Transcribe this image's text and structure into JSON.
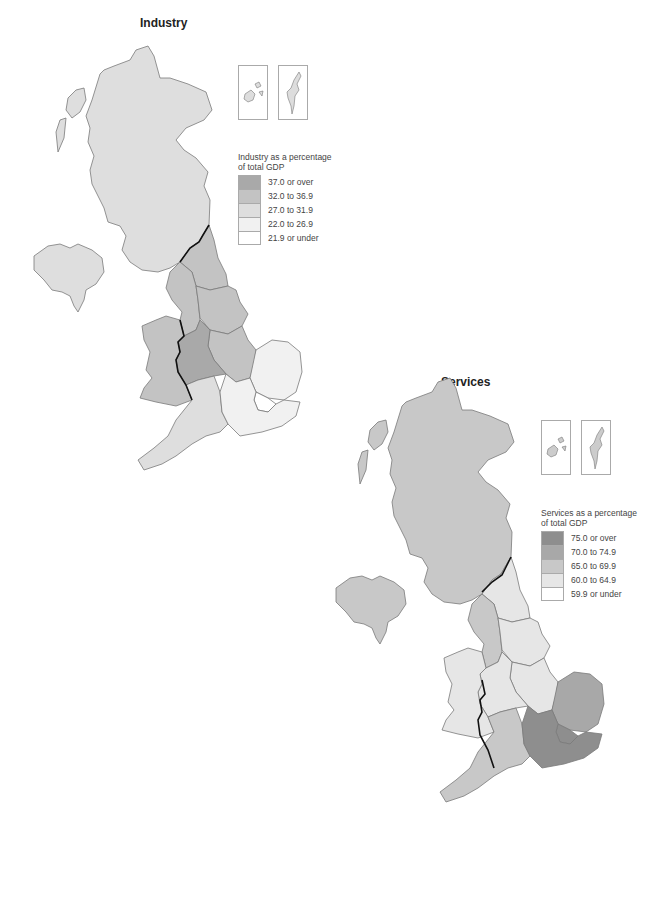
{
  "maps": [
    {
      "id": "industry",
      "title": "Industry",
      "legend": {
        "caption_line1": "Industry as a percentage",
        "caption_line2": "of total GDP",
        "classes": [
          {
            "label": "37.0 or over",
            "color": "#a9a9a9"
          },
          {
            "label": "32.0 to 36.9",
            "color": "#c3c3c3"
          },
          {
            "label": "27.0 to 31.9",
            "color": "#dedede"
          },
          {
            "label": "22.0 to 26.9",
            "color": "#f1f1f1"
          },
          {
            "label": "21.9 or under",
            "color": "#ffffff"
          }
        ]
      },
      "regions": {
        "scotland": "27.0 to 31.9",
        "northern_ireland": "27.0 to 31.9",
        "north_east": "32.0 to 36.9",
        "north_west": "32.0 to 36.9",
        "yorkshire_humber": "32.0 to 36.9",
        "east_midlands": "32.0 to 36.9",
        "west_midlands": "37.0 or over",
        "wales": "32.0 to 36.9",
        "south_west": "27.0 to 31.9",
        "east": "22.0 to 26.9",
        "london": "21.9 or under",
        "south_east": "22.0 to 26.9"
      }
    },
    {
      "id": "services",
      "title": "Services",
      "legend": {
        "caption_line1": "Services as a percentage",
        "caption_line2": "of total GDP",
        "classes": [
          {
            "label": "75.0 or over",
            "color": "#8e8e8e"
          },
          {
            "label": "70.0 to 74.9",
            "color": "#a8a8a8"
          },
          {
            "label": "65.0 to 69.9",
            "color": "#c8c8c8"
          },
          {
            "label": "60.0 to 64.9",
            "color": "#e6e6e6"
          },
          {
            "label": "59.9 or under",
            "color": "#ffffff"
          }
        ]
      },
      "regions": {
        "scotland": "65.0 to 69.9",
        "northern_ireland": "65.0 to 69.9",
        "north_east": "60.0 to 64.9",
        "north_west": "65.0 to 69.9",
        "yorkshire_humber": "60.0 to 64.9",
        "east_midlands": "60.0 to 64.9",
        "west_midlands": "60.0 to 64.9",
        "wales": "60.0 to 64.9",
        "south_west": "65.0 to 69.9",
        "east": "70.0 to 74.9",
        "london": "75.0 or over",
        "south_east": "75.0 or over"
      }
    }
  ]
}
